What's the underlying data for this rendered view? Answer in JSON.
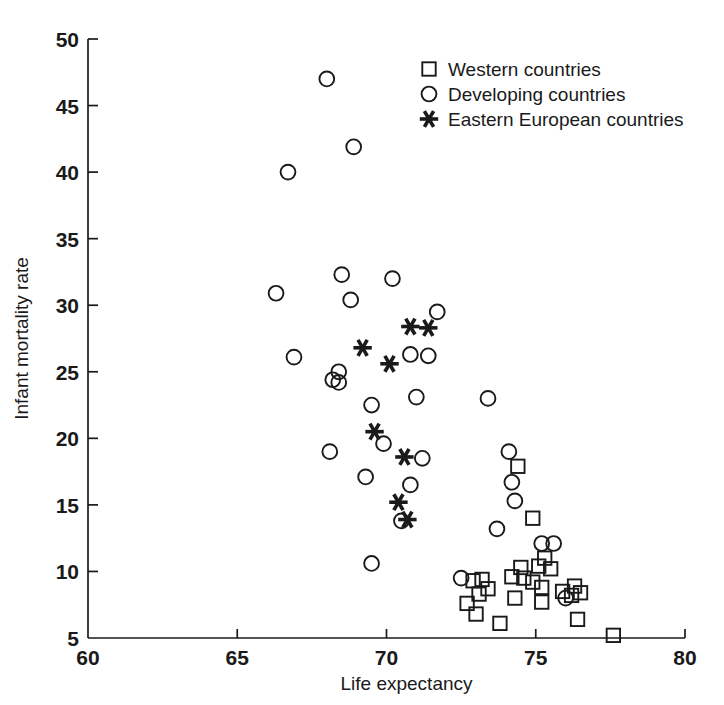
{
  "chart_data": {
    "type": "scatter",
    "title": "",
    "xlabel": "Life expectancy",
    "ylabel": "Infant mortality rate",
    "xlim": [
      60,
      80
    ],
    "ylim": [
      5,
      50
    ],
    "xticks": [
      60,
      65,
      70,
      75,
      80
    ],
    "yticks": [
      5,
      10,
      15,
      20,
      25,
      30,
      35,
      40,
      45,
      50
    ],
    "xtick_labels": [
      "60",
      "65",
      "70",
      "75",
      "80"
    ],
    "ytick_labels": [
      "5",
      "10",
      "15",
      "20",
      "25",
      "30",
      "35",
      "40",
      "45",
      "50"
    ],
    "grid": false,
    "legend_position": "top-center-right",
    "marker_color": "#1a1a1a",
    "series": [
      {
        "name": "Western countries",
        "marker": "square",
        "points": [
          [
            74.4,
            17.9
          ],
          [
            74.9,
            14.0
          ],
          [
            75.3,
            11.0
          ],
          [
            75.1,
            10.4
          ],
          [
            74.5,
            10.3
          ],
          [
            75.5,
            10.2
          ],
          [
            74.2,
            9.6
          ],
          [
            74.6,
            9.5
          ],
          [
            73.2,
            9.4
          ],
          [
            72.9,
            9.3
          ],
          [
            74.9,
            9.2
          ],
          [
            76.3,
            8.9
          ],
          [
            75.2,
            8.8
          ],
          [
            73.4,
            8.7
          ],
          [
            75.9,
            8.5
          ],
          [
            76.5,
            8.4
          ],
          [
            73.1,
            8.3
          ],
          [
            76.2,
            8.2
          ],
          [
            74.3,
            8.0
          ],
          [
            75.2,
            7.7
          ],
          [
            72.7,
            7.6
          ],
          [
            73.0,
            6.8
          ],
          [
            76.4,
            6.4
          ],
          [
            73.8,
            6.1
          ],
          [
            77.6,
            5.2
          ]
        ]
      },
      {
        "name": "Developing countries",
        "marker": "circle",
        "points": [
          [
            68.0,
            47.0
          ],
          [
            68.9,
            41.9
          ],
          [
            66.7,
            40.0
          ],
          [
            68.5,
            32.3
          ],
          [
            70.2,
            32.0
          ],
          [
            68.8,
            30.4
          ],
          [
            66.3,
            30.9
          ],
          [
            71.7,
            29.5
          ],
          [
            70.8,
            26.3
          ],
          [
            71.4,
            26.2
          ],
          [
            66.9,
            26.1
          ],
          [
            68.4,
            25.0
          ],
          [
            68.2,
            24.4
          ],
          [
            68.4,
            24.2
          ],
          [
            71.0,
            23.1
          ],
          [
            73.4,
            23.0
          ],
          [
            69.5,
            22.5
          ],
          [
            69.9,
            19.6
          ],
          [
            68.1,
            19.0
          ],
          [
            71.2,
            18.5
          ],
          [
            74.1,
            19.0
          ],
          [
            70.8,
            16.5
          ],
          [
            69.3,
            17.1
          ],
          [
            74.2,
            16.7
          ],
          [
            70.5,
            13.8
          ],
          [
            74.3,
            15.3
          ],
          [
            73.7,
            13.2
          ],
          [
            69.5,
            10.6
          ],
          [
            75.2,
            12.1
          ],
          [
            75.6,
            12.1
          ],
          [
            72.5,
            9.5
          ],
          [
            76.0,
            8.0
          ]
        ]
      },
      {
        "name": "Eastern European countries",
        "marker": "asterisk",
        "points": [
          [
            70.8,
            28.4
          ],
          [
            71.4,
            28.3
          ],
          [
            69.2,
            26.8
          ],
          [
            70.1,
            25.6
          ],
          [
            69.6,
            20.5
          ],
          [
            70.6,
            18.6
          ],
          [
            70.4,
            15.2
          ],
          [
            70.7,
            13.9
          ]
        ]
      }
    ]
  },
  "legend": {
    "items": [
      {
        "label": "Western countries",
        "marker": "square"
      },
      {
        "label": "Developing countries",
        "marker": "circle"
      },
      {
        "label": "Eastern European countries",
        "marker": "asterisk"
      }
    ]
  }
}
